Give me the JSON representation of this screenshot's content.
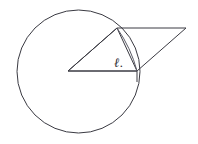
{
  "figure": {
    "background_color": "#ffffff",
    "stroke_color": "#3a3a42",
    "label_color": "#2b2b33",
    "labels": {
      "angle_label": "ℓ.",
      "angle_label_x": 114,
      "angle_label_y": 56
    },
    "circle": {
      "center_x": 78.5,
      "center_y": 71.5,
      "radius": 61.5
    },
    "parallelogram": {
      "points": "68,71 117,28 186,28 137,71"
    },
    "triangle": {
      "points": "68,71 117,28 137,71"
    },
    "chord_arc": {
      "path": "M 117,28 Q 131,48 137,71"
    },
    "tick": {
      "x1": 137,
      "y1": 71,
      "x2": 137,
      "y2": 82
    }
  }
}
